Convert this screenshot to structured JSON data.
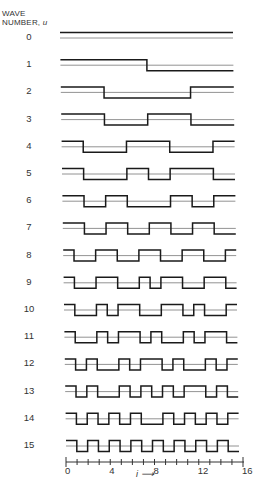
{
  "header": {
    "line1": "WAVE",
    "line2": "NUMBER, ",
    "var": "u"
  },
  "chart_data": {
    "type": "line",
    "xlabel": "i",
    "ylabel": "WAVE NUMBER, u",
    "x_ticks": [
      "0",
      "4",
      "8",
      "12",
      "16"
    ],
    "xlim": [
      0,
      16
    ],
    "grid": false,
    "series": [
      {
        "name": "0",
        "values": [
          1,
          1,
          1,
          1,
          1,
          1,
          1,
          1,
          1,
          1,
          1,
          1,
          1,
          1,
          1,
          1
        ]
      },
      {
        "name": "1",
        "values": [
          1,
          1,
          1,
          1,
          1,
          1,
          1,
          1,
          -1,
          -1,
          -1,
          -1,
          -1,
          -1,
          -1,
          -1
        ]
      },
      {
        "name": "2",
        "values": [
          1,
          1,
          1,
          1,
          -1,
          -1,
          -1,
          -1,
          -1,
          -1,
          -1,
          -1,
          1,
          1,
          1,
          1
        ]
      },
      {
        "name": "3",
        "values": [
          1,
          1,
          1,
          1,
          -1,
          -1,
          -1,
          -1,
          1,
          1,
          1,
          1,
          -1,
          -1,
          -1,
          -1
        ]
      },
      {
        "name": "4",
        "values": [
          1,
          1,
          -1,
          -1,
          -1,
          -1,
          1,
          1,
          1,
          1,
          -1,
          -1,
          -1,
          -1,
          1,
          1
        ]
      },
      {
        "name": "5",
        "values": [
          1,
          1,
          -1,
          -1,
          -1,
          -1,
          1,
          1,
          -1,
          -1,
          1,
          1,
          1,
          1,
          -1,
          -1
        ]
      },
      {
        "name": "6",
        "values": [
          1,
          1,
          -1,
          -1,
          1,
          1,
          -1,
          -1,
          -1,
          -1,
          1,
          1,
          -1,
          -1,
          1,
          1
        ]
      },
      {
        "name": "7",
        "values": [
          1,
          1,
          -1,
          -1,
          1,
          1,
          -1,
          -1,
          1,
          1,
          -1,
          -1,
          1,
          1,
          -1,
          -1
        ]
      },
      {
        "name": "8",
        "values": [
          1,
          -1,
          -1,
          1,
          1,
          -1,
          -1,
          1,
          1,
          -1,
          -1,
          1,
          1,
          -1,
          -1,
          1
        ]
      },
      {
        "name": "9",
        "values": [
          1,
          -1,
          -1,
          1,
          1,
          -1,
          -1,
          1,
          -1,
          1,
          1,
          -1,
          -1,
          1,
          1,
          -1
        ]
      },
      {
        "name": "10",
        "values": [
          1,
          -1,
          -1,
          1,
          -1,
          1,
          1,
          -1,
          -1,
          1,
          1,
          -1,
          1,
          -1,
          -1,
          1
        ]
      },
      {
        "name": "11",
        "values": [
          1,
          -1,
          -1,
          1,
          -1,
          1,
          1,
          -1,
          1,
          -1,
          -1,
          1,
          -1,
          1,
          1,
          -1
        ]
      },
      {
        "name": "12",
        "values": [
          1,
          -1,
          1,
          -1,
          -1,
          1,
          -1,
          1,
          1,
          -1,
          1,
          -1,
          -1,
          1,
          -1,
          1
        ]
      },
      {
        "name": "13",
        "values": [
          1,
          -1,
          1,
          -1,
          -1,
          1,
          -1,
          1,
          -1,
          1,
          -1,
          1,
          1,
          -1,
          1,
          -1
        ]
      },
      {
        "name": "14",
        "values": [
          1,
          -1,
          1,
          -1,
          1,
          -1,
          1,
          -1,
          -1,
          1,
          -1,
          1,
          -1,
          1,
          -1,
          1
        ]
      },
      {
        "name": "15",
        "values": [
          1,
          -1,
          1,
          -1,
          1,
          -1,
          1,
          -1,
          1,
          -1,
          1,
          -1,
          1,
          -1,
          1,
          -1
        ]
      }
    ]
  },
  "axis": {
    "ticks": [
      {
        "label": "0",
        "value": 0
      },
      {
        "label": "4",
        "value": 4
      },
      {
        "label": "8",
        "value": 8
      },
      {
        "label": "12",
        "value": 12
      },
      {
        "label": "16",
        "value": 16
      }
    ],
    "i_label": "i",
    "arrow": "⟶"
  }
}
